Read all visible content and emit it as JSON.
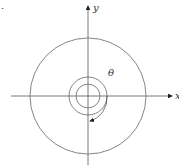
{
  "figure": {
    "problem_marker": ".",
    "x_axis_label": "x",
    "y_axis_label": "y",
    "angle_label": "θ",
    "line_color": "#555555",
    "arrow_color": "#222222"
  }
}
